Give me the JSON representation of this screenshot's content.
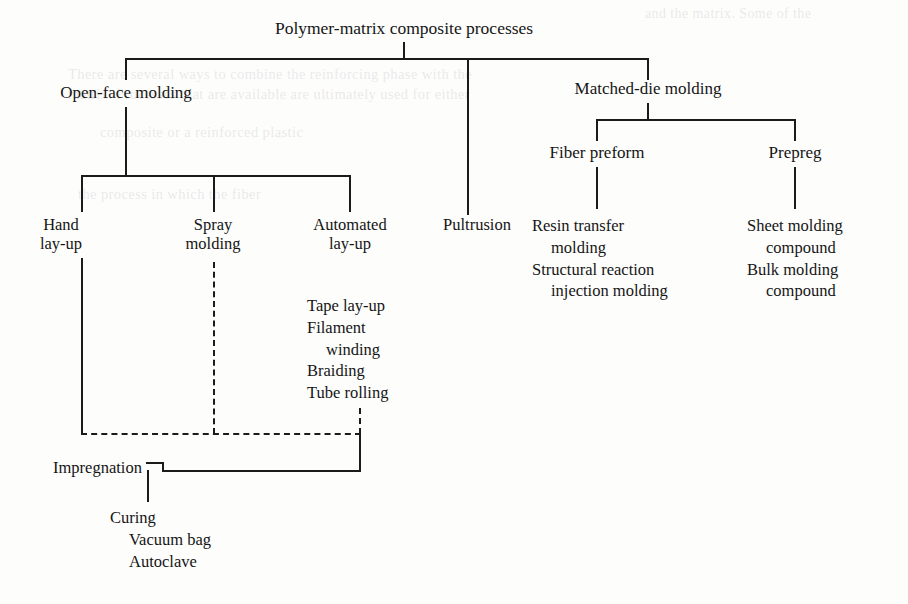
{
  "diagram": {
    "title": "Polymer-matrix composite processes",
    "level2": {
      "open_face": "Open-face molding",
      "matched_die": "Matched-die molding"
    },
    "level3": {
      "fiber_preform": "Fiber preform",
      "prepreg": "Prepreg"
    },
    "leaves": {
      "hand_layup_l1": "Hand",
      "hand_layup_l2": "lay-up",
      "spray_molding_l1": "Spray",
      "spray_molding_l2": "molding",
      "automated_layup_l1": "Automated",
      "automated_layup_l2": "lay-up",
      "pultrusion": "Pultrusion"
    },
    "automated_sublist": {
      "item1": "Tape lay-up",
      "item2_l1": "Filament",
      "item2_l2": "winding",
      "item3": "Braiding",
      "item4": "Tube rolling"
    },
    "fiber_preform_sublist": {
      "item1_l1": "Resin transfer",
      "item1_l2": "molding",
      "item2_l1": "Structural reaction",
      "item2_l2": "injection molding"
    },
    "prepreg_sublist": {
      "item1_l1": "Sheet molding",
      "item1_l2": "compound",
      "item2_l1": "Bulk molding",
      "item2_l2": "compound"
    },
    "bottom": {
      "impregnation": "Impregnation",
      "curing": "Curing",
      "vacuum_bag": "Vacuum bag",
      "autoclave": "Autoclave"
    },
    "line_color": "#1b1b1b",
    "background_color": "#fdfdfc"
  },
  "ghost_text": {
    "g1": "and the matrix. Some of the",
    "g2": "There are several ways to combine the reinforcing phase with the",
    "g3": "matrix. Processes that are available are ultimately used for either",
    "g4": "composite or a reinforced plastic",
    "g5": "the process in which the fiber"
  }
}
